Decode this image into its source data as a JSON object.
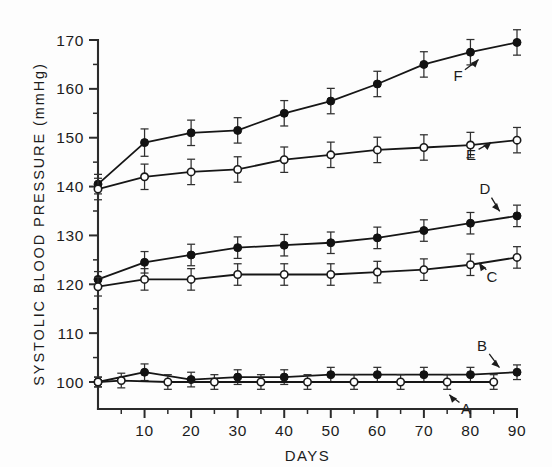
{
  "chart_data": {
    "type": "line",
    "title": "",
    "xlabel": "DAYS",
    "ylabel": "SYSTOLIC BLOOD PRESSURE (mmHg)",
    "xlim": [
      0,
      90
    ],
    "ylim": [
      100,
      170
    ],
    "xticks": [
      0,
      10,
      20,
      30,
      40,
      50,
      60,
      70,
      80,
      90
    ],
    "xtick_labels": [
      "",
      "10",
      "20",
      "30",
      "40",
      "50",
      "60",
      "70",
      "80",
      "90"
    ],
    "xminor_ticks": [
      5,
      15,
      25,
      35,
      45,
      55,
      65,
      75,
      85
    ],
    "yticks": [
      100,
      110,
      120,
      130,
      140,
      150,
      160,
      170
    ],
    "ytick_labels": [
      "100",
      "110",
      "120",
      "130",
      "140",
      "150",
      "160",
      "170"
    ],
    "yminor_ticks": [
      105,
      115,
      125,
      135,
      145,
      155,
      165
    ],
    "grid": false,
    "legend": "in-plot curve labels with leader arrows",
    "error_bars": "mean +/- SEM, vertical capped bars on every point",
    "series": [
      {
        "name": "F",
        "label": "F",
        "marker": "filled-circle",
        "x": [
          0,
          10,
          20,
          30,
          40,
          50,
          60,
          70,
          80,
          90
        ],
        "values": [
          140.5,
          149.0,
          151.0,
          151.5,
          155.0,
          157.5,
          161.0,
          165.0,
          167.5,
          169.5
        ],
        "errors": [
          2.0,
          2.8,
          2.6,
          2.6,
          2.6,
          2.6,
          2.6,
          2.6,
          2.6,
          2.6
        ]
      },
      {
        "name": "E",
        "label": "E",
        "marker": "open-circle",
        "x": [
          0,
          10,
          20,
          30,
          40,
          50,
          60,
          70,
          80,
          90
        ],
        "values": [
          139.5,
          142.0,
          143.0,
          143.5,
          145.5,
          146.5,
          147.5,
          148.0,
          148.5,
          149.5
        ],
        "errors": [
          2.2,
          2.6,
          2.6,
          2.6,
          2.6,
          2.6,
          2.6,
          2.6,
          2.6,
          2.6
        ]
      },
      {
        "name": "D",
        "label": "D",
        "marker": "filled-circle",
        "x": [
          0,
          10,
          20,
          30,
          40,
          50,
          60,
          70,
          80,
          90
        ],
        "values": [
          121.0,
          124.5,
          126.0,
          127.5,
          128.0,
          128.5,
          129.5,
          131.0,
          132.5,
          134.0
        ],
        "errors": [
          1.6,
          2.2,
          2.2,
          2.2,
          2.2,
          2.2,
          2.2,
          2.2,
          2.2,
          2.2
        ]
      },
      {
        "name": "C",
        "label": "C",
        "marker": "open-circle",
        "x": [
          0,
          10,
          20,
          30,
          40,
          50,
          60,
          70,
          80,
          90
        ],
        "values": [
          119.5,
          121.0,
          121.0,
          122.0,
          122.0,
          122.0,
          122.5,
          123.0,
          124.0,
          125.5
        ],
        "errors": [
          1.9,
          2.2,
          2.2,
          2.2,
          2.2,
          2.2,
          2.2,
          2.2,
          2.2,
          2.2
        ]
      },
      {
        "name": "B",
        "label": "B",
        "marker": "filled-circle",
        "x": [
          0,
          10,
          20,
          30,
          40,
          50,
          60,
          70,
          80,
          90
        ],
        "values": [
          100.0,
          102.0,
          100.5,
          101.0,
          101.0,
          101.5,
          101.5,
          101.5,
          101.5,
          102.0
        ],
        "errors": [
          1.0,
          1.7,
          1.5,
          1.5,
          1.5,
          1.5,
          1.5,
          1.5,
          1.5,
          1.5
        ]
      },
      {
        "name": "A",
        "label": "A",
        "marker": "open-circle",
        "x": [
          0,
          5,
          15,
          25,
          35,
          45,
          55,
          65,
          75,
          85
        ],
        "values": [
          100.0,
          100.3,
          100.0,
          100.0,
          100.0,
          100.0,
          100.0,
          100.0,
          100.0,
          100.0
        ],
        "errors": [
          1.0,
          1.5,
          1.5,
          1.5,
          1.5,
          1.5,
          1.5,
          1.5,
          1.5,
          1.5
        ]
      }
    ],
    "annotations": [
      {
        "label": "F",
        "x": 72,
        "y": 161.0,
        "text_px": [
          458,
          81
        ],
        "arrow_to_px": [
          481,
          57
        ]
      },
      {
        "label": "E",
        "x": 72,
        "y": 146.0,
        "text_px": [
          471,
          160
        ],
        "arrow_to_px": [
          494,
          140
        ]
      },
      {
        "label": "D",
        "x": 83,
        "y": 139.0,
        "text_px": [
          485,
          194
        ],
        "arrow_to_px": [
          502,
          214
        ]
      },
      {
        "label": "C",
        "x": 83,
        "y": 118.0,
        "text_px": [
          492,
          282
        ],
        "arrow_to_px": [
          477,
          260
        ]
      },
      {
        "label": "B",
        "x": 82,
        "y": 108.0,
        "text_px": [
          482,
          351
        ],
        "arrow_to_px": [
          502,
          370
        ]
      },
      {
        "label": "A",
        "x": 79,
        "y": 96.0,
        "text_px": [
          466,
          414
        ],
        "arrow_to_px": [
          447,
          392
        ]
      }
    ]
  }
}
